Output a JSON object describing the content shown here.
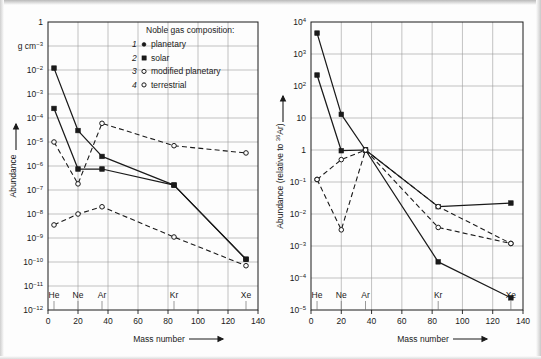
{
  "figure": {
    "caption_present": false,
    "panel_count": 2
  },
  "legend": {
    "title": "Noble gas composition:",
    "items": [
      {
        "number": "1",
        "marker": "filled-small-circle",
        "label": "planetary"
      },
      {
        "number": "2",
        "marker": "filled-square",
        "label": "solar"
      },
      {
        "number": "3",
        "marker": "open-circle",
        "label": "modified planetary"
      },
      {
        "number": "4",
        "marker": "open-circle",
        "label": "terrestrial"
      }
    ]
  },
  "elements": {
    "names": [
      "He",
      "Ne",
      "Ar",
      "Kr",
      "Xe"
    ],
    "mass_numbers": [
      4,
      20,
      36,
      84,
      132
    ]
  },
  "axis_common": {
    "xlabel": "Mass number",
    "xlabel_arrow": "⟶",
    "xlim": [
      0,
      140
    ],
    "xticks": [
      0,
      20,
      40,
      60,
      80,
      100,
      120,
      140
    ],
    "xtick_labels": [
      "0",
      "20",
      "40",
      "60",
      "80",
      "100",
      "120",
      "140"
    ],
    "grid": true
  },
  "chart_data": [
    {
      "id": "left-panel",
      "type": "line",
      "title": "",
      "xlabel": "Mass number",
      "ylabel": "Abundance",
      "ylabel_arrow": "↑",
      "yunit": "g cm⁻³",
      "xlim": [
        0,
        140
      ],
      "ylim": [
        1e-12,
        1
      ],
      "xticks": [
        0,
        20,
        40,
        60,
        80,
        100,
        120,
        140
      ],
      "xtick_labels": [
        "0",
        "20",
        "40",
        "60",
        "80",
        "100",
        "120",
        "140"
      ],
      "ytick_exponents": [
        0,
        -1,
        -2,
        -3,
        -4,
        -5,
        -6,
        -7,
        -8,
        -9,
        -10,
        -11,
        -12
      ],
      "ytick_labels": [
        "1",
        "",
        "10-2",
        "10-3",
        "10-4",
        "10-5",
        "10-6",
        "10-7",
        "10-8",
        "10-9",
        "10-10",
        "10-11",
        "10-12"
      ],
      "grid": true,
      "legend_position": "top-right",
      "element_markers": [
        "He",
        "Ne",
        "Ar",
        "Kr",
        "Xe"
      ],
      "series": [
        {
          "name": "planetary",
          "number": "1",
          "style": "solid",
          "marker": "filled",
          "x": [
            4,
            20,
            36,
            84,
            132
          ],
          "y": [
            0.00025,
            7.5e-07,
            7.5e-07,
            1.6e-07,
            1.3e-10
          ]
        },
        {
          "name": "solar",
          "number": "2",
          "style": "solid",
          "marker": "filled",
          "x": [
            4,
            20,
            36,
            84,
            132
          ],
          "y": [
            0.012,
            3e-05,
            2.5e-06,
            1.6e-07,
            1.3e-10
          ]
        },
        {
          "name": "modified planetary",
          "number": "3",
          "style": "dashed",
          "marker": "open",
          "x": [
            4,
            20,
            36,
            84,
            132
          ],
          "y": [
            1e-05,
            1.8e-07,
            6e-05,
            7e-06,
            3.5e-06
          ]
        },
        {
          "name": "terrestrial",
          "number": "4",
          "style": "dashed",
          "marker": "open",
          "x": [
            4,
            20,
            36,
            84,
            132
          ],
          "y": [
            3.5e-09,
            1e-08,
            2e-08,
            1.1e-09,
            7e-11
          ]
        }
      ]
    },
    {
      "id": "right-panel",
      "type": "line",
      "title": "",
      "xlabel": "Mass number",
      "ylabel": "Abundance (relative to 36Ar)",
      "ylabel_arrow": "↑",
      "xlim": [
        0,
        140
      ],
      "ylim": [
        1e-05,
        10000
      ],
      "xticks": [
        0,
        20,
        40,
        60,
        80,
        100,
        120,
        140
      ],
      "xtick_labels": [
        "0",
        "20",
        "40",
        "60",
        "80",
        "100",
        "120",
        "140"
      ],
      "ytick_exponents": [
        4,
        3,
        2,
        1,
        0,
        -1,
        -2,
        -3,
        -4,
        -5
      ],
      "ytick_labels": [
        "104",
        "103",
        "102",
        "10",
        "1",
        "10-1",
        "10-2",
        "10-3",
        "10-4",
        "10-5"
      ],
      "grid": true,
      "legend_position": "none",
      "element_markers": [
        "He",
        "Ne",
        "Ar",
        "Kr",
        "Xe"
      ],
      "series": [
        {
          "name": "planetary",
          "number": "1",
          "style": "solid",
          "marker": "filled",
          "x": [
            4,
            20,
            36,
            84,
            132
          ],
          "y": [
            220,
            0.95,
            1.0,
            0.00032,
            2.4e-05
          ]
        },
        {
          "name": "solar",
          "number": "2",
          "style": "solid",
          "marker": "filled",
          "x": [
            4,
            20,
            36,
            84,
            132
          ],
          "y": [
            4500,
            13,
            1.0,
            0.017,
            0.022
          ]
        },
        {
          "name": "modified planetary",
          "number": "3",
          "style": "dashed",
          "marker": "open",
          "x": [
            4,
            20,
            36,
            84,
            132
          ],
          "y": [
            0.12,
            0.5,
            1.0,
            0.017,
            0.0012
          ]
        },
        {
          "name": "terrestrial",
          "number": "4",
          "style": "dashed",
          "marker": "open",
          "x": [
            4,
            20,
            36,
            84,
            132
          ],
          "y": [
            0.12,
            0.0032,
            1.0,
            0.0038,
            0.0012
          ]
        }
      ]
    }
  ]
}
